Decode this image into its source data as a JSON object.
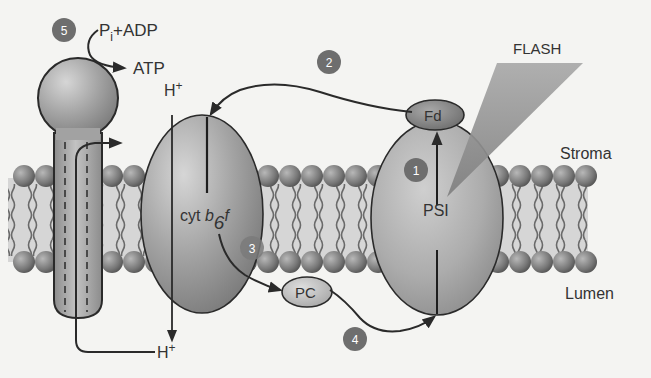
{
  "diagram": {
    "type": "thylakoid membrane electron transport (cyclic photophosphorylation)",
    "regions": {
      "stroma": "Stroma",
      "lumen": "Lumen"
    },
    "light": {
      "label": "FLASH"
    },
    "complexes": {
      "atp_synthase": {
        "reactant": "P",
        "reactant_sub": "i",
        "reactant_rest": "+ADP",
        "product": "ATP"
      },
      "cytb6f": {
        "label_main": "cyt ",
        "label_b": "b",
        "label_sub": "6",
        "label_f": "f"
      },
      "psi": {
        "label": "PSI"
      },
      "fd": {
        "label": "Fd"
      },
      "pc": {
        "label": "PC"
      }
    },
    "protons": {
      "top": "H+",
      "bottom": "H+",
      "top_base": "H",
      "top_sup": "+",
      "bottom_base": "H",
      "bottom_sup": "+"
    },
    "steps": [
      {
        "num": "1"
      },
      {
        "num": "2"
      },
      {
        "num": "3"
      },
      {
        "num": "4"
      },
      {
        "num": "5"
      }
    ],
    "colors": {
      "background": "#f4f4f2",
      "protein_fill": "#9a9a9a",
      "protein_light": "#c8c8c8",
      "outline": "#2a2a2a",
      "step_badge": "#6e6e6e",
      "lipid_head": "#7a7a7a",
      "membrane_core": "#d4d4d4",
      "flash_beam": "#8f8f8f"
    }
  }
}
